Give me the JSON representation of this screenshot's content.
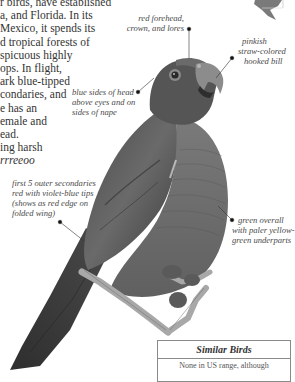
{
  "body_text": {
    "lines": [
      "r birds, have established",
      "a, and Florida. In its",
      " Mexico, it spends its",
      "d tropical forests of",
      "spicuous highly",
      "ops. In flight,",
      "ark blue-tipped",
      "condaries, and",
      "e has an",
      "emale and",
      "ead.",
      "ing harsh"
    ],
    "call_text": "rrreeoo"
  },
  "annotations": {
    "forehead": [
      "red forehead,",
      "crown, and lores"
    ],
    "bill": [
      "pinkish",
      "straw-colored",
      "hooked bill"
    ],
    "head_sides": [
      "blue sides of head",
      "above eyes and on",
      "sides of nape"
    ],
    "secondaries": [
      "first 5 outer secondaries",
      "red with violet-blue tips",
      "(shows as red edge on",
      "folded wing)"
    ],
    "underparts": [
      "green overall",
      "with paler yellow-",
      "green underparts"
    ]
  },
  "similar_birds": {
    "heading": "Similar Birds",
    "text": "None in US range, although"
  },
  "colors": {
    "text": "#333333",
    "annotation": "#4a4a4a",
    "box_border": "#8a8a8a",
    "bird_dark": "#3a3a3a",
    "bird_mid": "#6e6e6e"
  }
}
